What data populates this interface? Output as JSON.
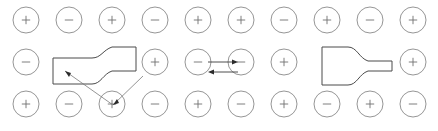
{
  "figure": {
    "width": 438,
    "height": 131,
    "background": "#ffffff",
    "type": "ionic-lattice-diagram"
  },
  "colors": {
    "circle_stroke": "#8a8a8a",
    "sign_stroke": "#6f6f6f",
    "shape_stroke": "#4a4a4a",
    "callout_stroke": "#7a7a7a",
    "arrow_fill": "#2b2b2b"
  },
  "lattice": {
    "rows": 3,
    "columns": 10,
    "radius": 13,
    "start_x": 26,
    "start_y": 20,
    "step_x": 43,
    "step_y": 42,
    "positive_symbol": "+",
    "negative_symbol": "−",
    "grid": [
      {
        "row_index": 0,
        "row_name": "top-row",
        "cells": [
          {
            "col": 0,
            "charge": "+",
            "visible": true
          },
          {
            "col": 1,
            "charge": "-",
            "visible": true
          },
          {
            "col": 2,
            "charge": "+",
            "visible": true
          },
          {
            "col": 3,
            "charge": "-",
            "visible": true
          },
          {
            "col": 4,
            "charge": "+",
            "visible": true
          },
          {
            "col": 5,
            "charge": "+",
            "visible": true
          },
          {
            "col": 6,
            "charge": "-",
            "visible": true
          },
          {
            "col": 7,
            "charge": "+",
            "visible": true
          },
          {
            "col": 8,
            "charge": "-",
            "visible": true
          },
          {
            "col": 9,
            "charge": "+",
            "visible": true
          }
        ]
      },
      {
        "row_index": 1,
        "row_name": "middle-row",
        "cells": [
          {
            "col": 0,
            "charge": "-",
            "visible": true
          },
          {
            "col": 1,
            "charge": "+",
            "visible": false
          },
          {
            "col": 2,
            "charge": "-",
            "visible": false
          },
          {
            "col": 3,
            "charge": "+",
            "visible": true
          },
          {
            "col": 4,
            "charge": "-",
            "visible": true
          },
          {
            "col": 5,
            "charge": "-",
            "visible": true
          },
          {
            "col": 6,
            "charge": "+",
            "visible": true
          },
          {
            "col": 7,
            "charge": "-",
            "visible": false
          },
          {
            "col": 8,
            "charge": "+",
            "visible": false
          },
          {
            "col": 9,
            "charge": "+",
            "visible": true
          }
        ]
      },
      {
        "row_index": 2,
        "row_name": "bottom-row",
        "cells": [
          {
            "col": 0,
            "charge": "+",
            "visible": true
          },
          {
            "col": 1,
            "charge": "-",
            "visible": true
          },
          {
            "col": 2,
            "charge": "+",
            "visible": true
          },
          {
            "col": 3,
            "charge": "-",
            "visible": true
          },
          {
            "col": 4,
            "charge": "+",
            "visible": true
          },
          {
            "col": 5,
            "charge": "-",
            "visible": true
          },
          {
            "col": 6,
            "charge": "+",
            "visible": true
          },
          {
            "col": 7,
            "charge": "-",
            "visible": true
          },
          {
            "col": 8,
            "charge": "+",
            "visible": true
          },
          {
            "col": 9,
            "charge": "-",
            "visible": true
          }
        ]
      }
    ]
  },
  "regions": [
    {
      "name": "left-region-shape",
      "orientation": "narrow-left-wide-right",
      "path": "M 53 58 L 53 84 L 92 84 C 101 84 103 74 112 71 L 136 71 L 136 47 L 112 47 C 103 50 101 58 92 58 Z"
    },
    {
      "name": "right-region-shape",
      "orientation": "wide-left-narrow-right",
      "path": "M 322 47 L 322 85 L 348 85 C 357 85 359 74 368 71 L 392 71 L 392 61 L 368 61 C 359 58 357 47 348 47 Z"
    }
  ],
  "callouts": [
    {
      "name": "callout-to-region-interior",
      "line": "M 113 105 L 65 71",
      "head_points": "65,71 71,73 69,77",
      "origin": "bottom-row-col-2-circle",
      "target": "left-region-shape-interior"
    },
    {
      "name": "callout-to-region-edge",
      "line": "M 113 105 L 143 76",
      "head_points": "113,105 119,103 117,99",
      "origin": "bottom-row-col-2-circle",
      "target": "left-region-shape-edge"
    }
  ],
  "exchange_arrows": {
    "name": "ion-exchange-arrow-pair",
    "between": [
      "middle-row-col-4-circle",
      "middle-row-col-5-circle"
    ],
    "arrows": [
      {
        "name": "arrow-right",
        "direction": "right",
        "line": "M 208 62 L 234 62",
        "head_points": "238,62 232,59.5 232,64.5"
      },
      {
        "name": "arrow-left",
        "direction": "left",
        "line": "M 238 72 L 212 72",
        "head_points": "208,72 214,69.5 214,74.5"
      }
    ]
  }
}
